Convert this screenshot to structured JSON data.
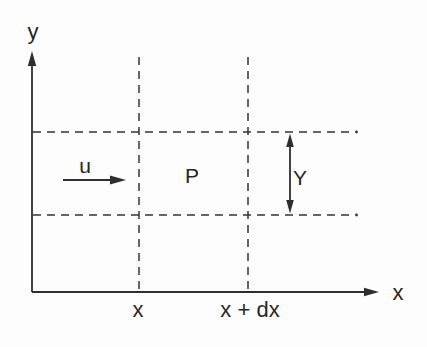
{
  "diagram": {
    "background_color": "#fdfdfd",
    "ink_color": "#2e2e2e",
    "axes": {
      "y_label": "y",
      "x_label": "x"
    },
    "region": {
      "velocity_label": "u",
      "point_label": "P",
      "height_label": "Y"
    },
    "ticks": {
      "x_left_label": "x",
      "x_right_label": "x + dx"
    }
  }
}
